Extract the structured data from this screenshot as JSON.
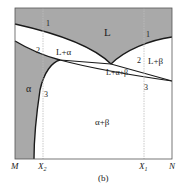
{
  "figure": {
    "caption": "(b)",
    "type": "binary eutectic phase diagram",
    "colors": {
      "shaded": "#a9a9a9",
      "line": "#1a1a1a",
      "guide": "#bdbdbd",
      "frame": "#555555"
    }
  },
  "axis": {
    "left_label": "M",
    "right_label": "N",
    "ticks": [
      {
        "label": "X",
        "sub": "2"
      },
      {
        "label": "X",
        "sub": "1"
      }
    ]
  },
  "regions": {
    "liquid": "L",
    "liquid_alpha": "L+α",
    "liquid_beta": "L+β",
    "three_phase": "L+α+β",
    "alpha": "α",
    "alpha_beta": "α+β"
  },
  "points_x2": [
    "1",
    "2",
    "3"
  ],
  "points_x1": [
    "1",
    "2",
    "3"
  ]
}
